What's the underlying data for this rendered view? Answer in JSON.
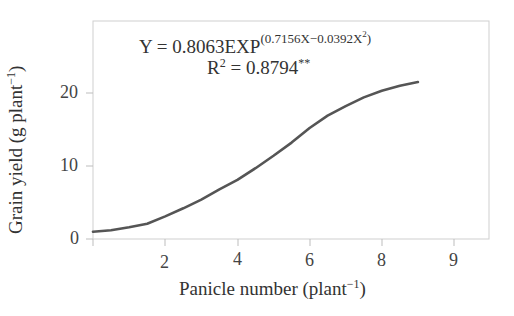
{
  "chart_data": {
    "type": "line",
    "title": "",
    "xlabel": "Panicle number (plant⁻¹)",
    "ylabel": "Grain yield (g plant⁻¹)",
    "xlabel_main": "Panicle number (plant",
    "xlabel_sup": "−1",
    "ylabel_main": "Grain yield (g plant",
    "ylabel_sup": "−1",
    "x_ticks": [
      "2",
      "4",
      "6",
      "8",
      "9"
    ],
    "y_ticks": [
      "0",
      "10",
      "20"
    ],
    "xlim": [
      0,
      10.9
    ],
    "ylim": [
      0,
      24.7
    ],
    "grid": false,
    "legend": null,
    "annotations": {
      "equation_prefix": "Y = 0.8063EXP",
      "equation_exponent": "(0.7156X−0.0392X",
      "equation_exponent_sup": "2",
      "equation_exponent_close": ")",
      "r2_prefix": "R",
      "r2_sup": "2",
      "r2_value": " = 0.8794",
      "r2_sig": "**"
    },
    "series": [
      {
        "name": "Fitted curve",
        "color": "#555555",
        "x": [
          0.0,
          0.5,
          1.0,
          1.5,
          2.0,
          2.5,
          3.0,
          3.5,
          4.0,
          4.5,
          5.0,
          5.5,
          6.0,
          6.5,
          7.0,
          7.5,
          8.0,
          8.5,
          9.0
        ],
        "y": [
          1.0,
          1.2,
          1.6,
          2.1,
          3.1,
          4.2,
          5.4,
          6.8,
          8.1,
          9.7,
          11.4,
          13.2,
          15.2,
          16.9,
          18.2,
          19.4,
          20.3,
          21.0,
          21.5
        ]
      }
    ]
  },
  "colors": {
    "frame": "#c8c8c8",
    "curve": "#555555",
    "text": "#333333"
  }
}
